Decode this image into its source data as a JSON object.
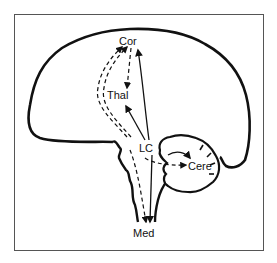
{
  "diagram": {
    "title": "",
    "type": "sagittal brain pathway diagram",
    "labels": {
      "cortex": "Cor",
      "thalamus": "Thal",
      "locus_coeruleus": "LC",
      "cerebellum": "Cere",
      "medulla": "Med"
    },
    "pathways": [
      {
        "from": "LC",
        "to": "Cor",
        "style": "solid"
      },
      {
        "from": "LC",
        "to": "Thal",
        "style": "solid"
      },
      {
        "from": "LC",
        "to": "Med",
        "style": "solid"
      },
      {
        "from": "LC",
        "to": "Cere",
        "style": "solid"
      },
      {
        "from": "Med",
        "to": "Cor",
        "style": "dashed"
      },
      {
        "from": "Cor",
        "to": "Thal",
        "style": "dashed"
      },
      {
        "from": "LC",
        "to": "Cere",
        "style": "dashed"
      },
      {
        "from": "LC",
        "to": "Med",
        "style": "dashed"
      }
    ],
    "colors": {
      "line": "#111111",
      "background": "#ffffff",
      "frame": "#555555"
    }
  }
}
